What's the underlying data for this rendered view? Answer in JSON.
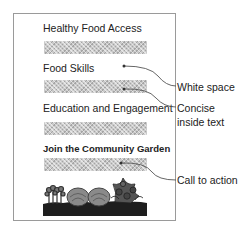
{
  "document": {
    "sections": [
      {
        "heading": "Healthy Food Access",
        "bold": false
      },
      {
        "heading": "Food Skills",
        "bold": false
      },
      {
        "heading": "Education and Engagement",
        "bold": false
      },
      {
        "heading": "Join the Community Garden",
        "bold": true
      }
    ],
    "illustration": "garden-plants-illustration"
  },
  "annotations": [
    {
      "label": "White space"
    },
    {
      "label": "Concise inside text"
    },
    {
      "label": "Call to action"
    }
  ],
  "colors": {
    "frame": "#9a9a9a",
    "text": "#222222",
    "hatch": "#c9c9c9",
    "soil": "#1e1e1e",
    "arrow": "#555555"
  }
}
